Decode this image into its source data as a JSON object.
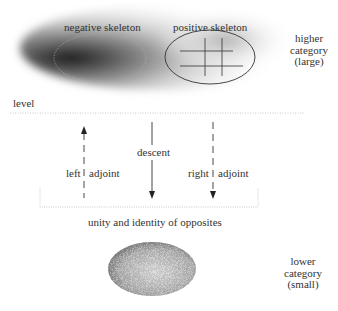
{
  "top": {
    "negative_label": "negative skeleton",
    "positive_label": "positive skeleton",
    "category_lines": [
      "higher",
      "category",
      "(large)"
    ]
  },
  "middle": {
    "level_label": "level",
    "descent_label": "descent",
    "left_label": "left",
    "left_adjoint_label": "adjoint",
    "right_label": "right",
    "right_adjoint_label": "adjoint",
    "unity_label": "unity and identity of opposites"
  },
  "bottom": {
    "category_lines": [
      "lower",
      "category",
      "(small)"
    ]
  }
}
